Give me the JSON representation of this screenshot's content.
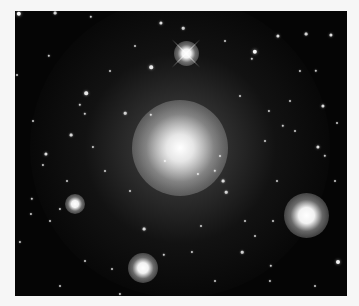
{
  "image": {
    "subject": "elliptical galaxy with surrounding star field",
    "background_color": "#050505",
    "page_color": "#f6f6f6"
  },
  "galaxy": {
    "cx": 165,
    "cy": 137,
    "core_radius": 30,
    "halo_radius": 150
  },
  "bright_stars": [
    {
      "x": 171,
      "y": 42,
      "r": 5,
      "spikes": true
    },
    {
      "x": 291,
      "y": 204,
      "r": 9,
      "spikes": false
    },
    {
      "x": 128,
      "y": 257,
      "r": 6,
      "spikes": false
    },
    {
      "x": 60,
      "y": 193,
      "r": 4,
      "spikes": false
    }
  ],
  "stars": [
    [
      4,
      3,
      2.2
    ],
    [
      40,
      2,
      1.4
    ],
    [
      76,
      6,
      1.2
    ],
    [
      146,
      12,
      1.6
    ],
    [
      168,
      17,
      1.3
    ],
    [
      240,
      41,
      2.2
    ],
    [
      263,
      25,
      1.6
    ],
    [
      291,
      23,
      1.4
    ],
    [
      316,
      24,
      1.6
    ],
    [
      136,
      56,
      1.8
    ],
    [
      71,
      82,
      1.8
    ],
    [
      65,
      94,
      1.2
    ],
    [
      34,
      45,
      1.2
    ],
    [
      70,
      103,
      1.2
    ],
    [
      110,
      102,
      1.3
    ],
    [
      136,
      104,
      1.2
    ],
    [
      56,
      124,
      1.4
    ],
    [
      31,
      143,
      1.6
    ],
    [
      28,
      154,
      1.1
    ],
    [
      17,
      188,
      1.2
    ],
    [
      78,
      136,
      1.1
    ],
    [
      308,
      95,
      1.6
    ],
    [
      301,
      60,
      1.2
    ],
    [
      285,
      60,
      1.1
    ],
    [
      237,
      48,
      1.2
    ],
    [
      303,
      136,
      1.6
    ],
    [
      310,
      145,
      1.2
    ],
    [
      150,
      150,
      1.1
    ],
    [
      200,
      160,
      1.2
    ],
    [
      208,
      170,
      1.4
    ],
    [
      211,
      181,
      1.3
    ],
    [
      183,
      163,
      1.1
    ],
    [
      205,
      145,
      1.0
    ],
    [
      129,
      218,
      1.4
    ],
    [
      149,
      244,
      1.2
    ],
    [
      227,
      241,
      1.3
    ],
    [
      177,
      241,
      1.1
    ],
    [
      323,
      251,
      2.0
    ],
    [
      256,
      255,
      1.2
    ],
    [
      255,
      270,
      1.1
    ],
    [
      105,
      283,
      1.1
    ],
    [
      97,
      258,
      1.0
    ],
    [
      45,
      198,
      1.1
    ],
    [
      35,
      210,
      1.0
    ],
    [
      16,
      203,
      1.1
    ],
    [
      5,
      231,
      1.1
    ],
    [
      2,
      64,
      1.0
    ],
    [
      322,
      112,
      1.0
    ],
    [
      320,
      170,
      1.0
    ],
    [
      275,
      90,
      1.0
    ],
    [
      254,
      100,
      1.1
    ],
    [
      250,
      130,
      1.0
    ],
    [
      262,
      170,
      1.0
    ],
    [
      230,
      210,
      1.0
    ],
    [
      186,
      215,
      1.0
    ],
    [
      70,
      250,
      1.0
    ],
    [
      45,
      275,
      1.0
    ],
    [
      200,
      270,
      1.0
    ],
    [
      300,
      275,
      1.0
    ],
    [
      95,
      60,
      1.0
    ],
    [
      120,
      35,
      1.0
    ],
    [
      210,
      30,
      1.0
    ],
    [
      225,
      85,
      1.0
    ],
    [
      90,
      160,
      1.0
    ],
    [
      115,
      180,
      1.0
    ],
    [
      268,
      115,
      1.2
    ],
    [
      280,
      120,
      1.0
    ],
    [
      258,
      210,
      1.0
    ],
    [
      240,
      225,
      1.0
    ],
    [
      18,
      110,
      1.0
    ],
    [
      52,
      170,
      1.0
    ]
  ]
}
